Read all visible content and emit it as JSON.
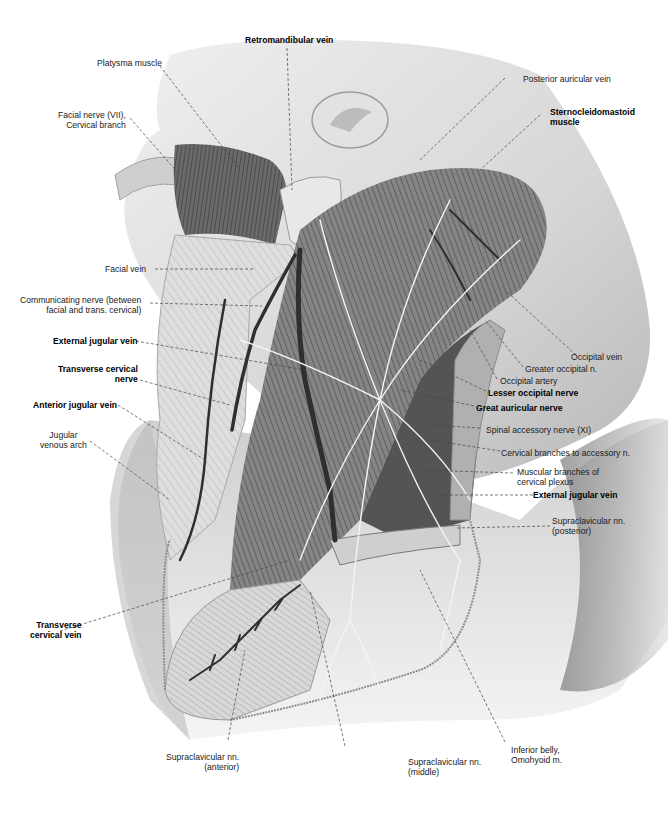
{
  "figure": {
    "colors": {
      "background": "#ffffff",
      "skin": "#d9d9d9",
      "muscle": "#6f6f6f",
      "vein": "#3a3a3a",
      "nerve": "#f2f2f2",
      "leader": "#444444"
    }
  },
  "labels": {
    "retromandibular_vein": {
      "text": "Retromandibular vein",
      "bold": true
    },
    "platysma_muscle": {
      "text": "Platysma muscle",
      "bold": false
    },
    "facial_nerve": {
      "line1": "Facial nerve (VII),",
      "line2": "Cervical branch",
      "bold": false
    },
    "posterior_auricular_vein": {
      "text": "Posterior auricular vein",
      "bold": false
    },
    "sternocleidomastoid": {
      "line1": "Sternocleidomastoid",
      "line2": "muscle",
      "bold": true
    },
    "facial_vein": {
      "text": "Facial vein",
      "bold": false
    },
    "communicating_nerve": {
      "line1": "Communicating nerve (between",
      "line2": "facial and trans. cervical)",
      "bold": false
    },
    "external_jugular_vein_left": {
      "text": "External jugular vein",
      "bold": true
    },
    "transverse_cervical_nerve": {
      "line1": "Transverse cervical",
      "line2": "nerve",
      "bold": true
    },
    "anterior_jugular_vein": {
      "text": "Anterior jugular vein",
      "bold": true
    },
    "jugular_venous_arch": {
      "line1": "Jugular",
      "line2": "venous arch",
      "bold": false
    },
    "occipital_vein": {
      "text": "Occipital vein",
      "bold": false
    },
    "greater_occipital_n": {
      "text": "Greater occipital n.",
      "bold": false
    },
    "occipital_artery": {
      "text": "Occipital artery",
      "bold": false
    },
    "lesser_occipital_nerve": {
      "text": "Lesser occipital nerve",
      "bold": true
    },
    "great_auricular_nerve": {
      "text": "Great auricular nerve",
      "bold": true
    },
    "spinal_accessory_nerve": {
      "text": "Spinal accessory nerve (XI)",
      "bold": false
    },
    "cervical_branches_accessory": {
      "text": "Cervical branches to accessory n.",
      "bold": false
    },
    "muscular_branches": {
      "line1": "Muscular branches of",
      "line2": "cervical plexus",
      "bold": false
    },
    "external_jugular_vein_right": {
      "text": "External jugular vein",
      "bold": true
    },
    "supraclavicular_posterior": {
      "line1": "Supraclavicular nn.",
      "line2": "(posterior)",
      "bold": false
    },
    "transverse_cervical_vein": {
      "line1": "Transverse",
      "line2": "cervical vein",
      "bold": true
    },
    "supraclavicular_anterior": {
      "line1": "Supraclavicular nn.",
      "line2": "(anterior)",
      "bold": false
    },
    "supraclavicular_middle": {
      "line1": "Supraclavicular nn.",
      "line2": "(middle)",
      "bold": false
    },
    "inferior_belly_omohyoid": {
      "line1": "Inferior belly,",
      "line2": "Omohyoid m.",
      "bold": false
    }
  }
}
